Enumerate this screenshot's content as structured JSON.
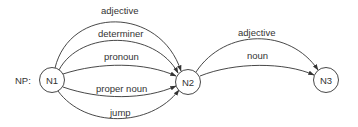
{
  "diagram": {
    "prefix_label": "NP:",
    "nodes": [
      {
        "id": "N1",
        "label": "N1",
        "cx": 52,
        "cy": 80
      },
      {
        "id": "N2",
        "label": "N2",
        "cx": 188,
        "cy": 82
      },
      {
        "id": "N3",
        "label": "N3",
        "cx": 326,
        "cy": 80
      }
    ],
    "edges": [
      {
        "from": "N1",
        "to": "N2",
        "label": "adjective"
      },
      {
        "from": "N1",
        "to": "N2",
        "label": "determiner"
      },
      {
        "from": "N1",
        "to": "N2",
        "label": "pronoun"
      },
      {
        "from": "N1",
        "to": "N2",
        "label": "proper noun"
      },
      {
        "from": "N1",
        "to": "N2",
        "label": "jump"
      },
      {
        "from": "N2",
        "to": "N3",
        "label": "adjective"
      },
      {
        "from": "N2",
        "to": "N3",
        "label": "noun"
      }
    ],
    "colors": {
      "stroke": "#333333",
      "text": "#333333",
      "background": "#ffffff"
    }
  }
}
